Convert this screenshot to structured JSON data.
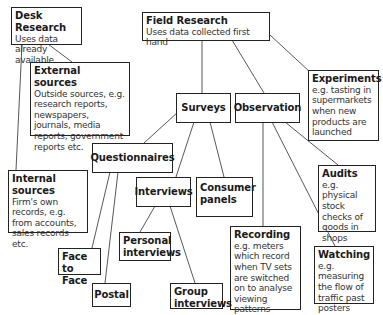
{
  "nodes": {
    "desk": {
      "title": "Desk Research",
      "desc": "Uses data already available"
    },
    "field": {
      "title": "Field Research",
      "desc": "Uses data collected first hand"
    },
    "external": {
      "title": "External sources",
      "desc": "Outside sources, e.g. research reports, newspapers, journals, media reports, government reports etc."
    },
    "internal": {
      "title": "Internal sources",
      "desc": "Firm's own records, e.g. from accounts, sales records etc."
    },
    "experiments": {
      "title": "Experiments",
      "desc": "e.g. tasting in supermarkets when new products are launched"
    },
    "surveys": {
      "title": "Surveys"
    },
    "observation": {
      "title": "Observation"
    },
    "questionnaires": {
      "title": "Questionnaires"
    },
    "interviews": {
      "title": "Interviews"
    },
    "consumer_panels": {
      "title": "Consumer panels"
    },
    "audits": {
      "title": "Audits",
      "desc": "e.g. physical stock checks of goods in shops"
    },
    "personal_interviews": {
      "title": "Personal interviews"
    },
    "face_to_face": {
      "title": "Face to Face"
    },
    "postal": {
      "title": "Postal"
    },
    "group_interviews": {
      "title": "Group interviews"
    },
    "recording": {
      "title": "Recording",
      "desc": "e.g. meters which record when TV sets are switched on to analyse viewing patterns"
    },
    "watching": {
      "title": "Watching",
      "desc": "e.g. measuring the flow of traffic past posters"
    }
  },
  "edges": [
    [
      "desk",
      "external"
    ],
    [
      "desk",
      "internal"
    ],
    [
      "field",
      "surveys"
    ],
    [
      "field",
      "observation"
    ],
    [
      "field",
      "experiments"
    ],
    [
      "surveys",
      "questionnaires"
    ],
    [
      "surveys",
      "interviews"
    ],
    [
      "surveys",
      "consumer_panels"
    ],
    [
      "questionnaires",
      "face_to_face"
    ],
    [
      "questionnaires",
      "postal"
    ],
    [
      "interviews",
      "personal_interviews"
    ],
    [
      "interviews",
      "group_interviews"
    ],
    [
      "observation",
      "recording"
    ],
    [
      "observation",
      "watching"
    ],
    [
      "observation",
      "audits"
    ]
  ]
}
